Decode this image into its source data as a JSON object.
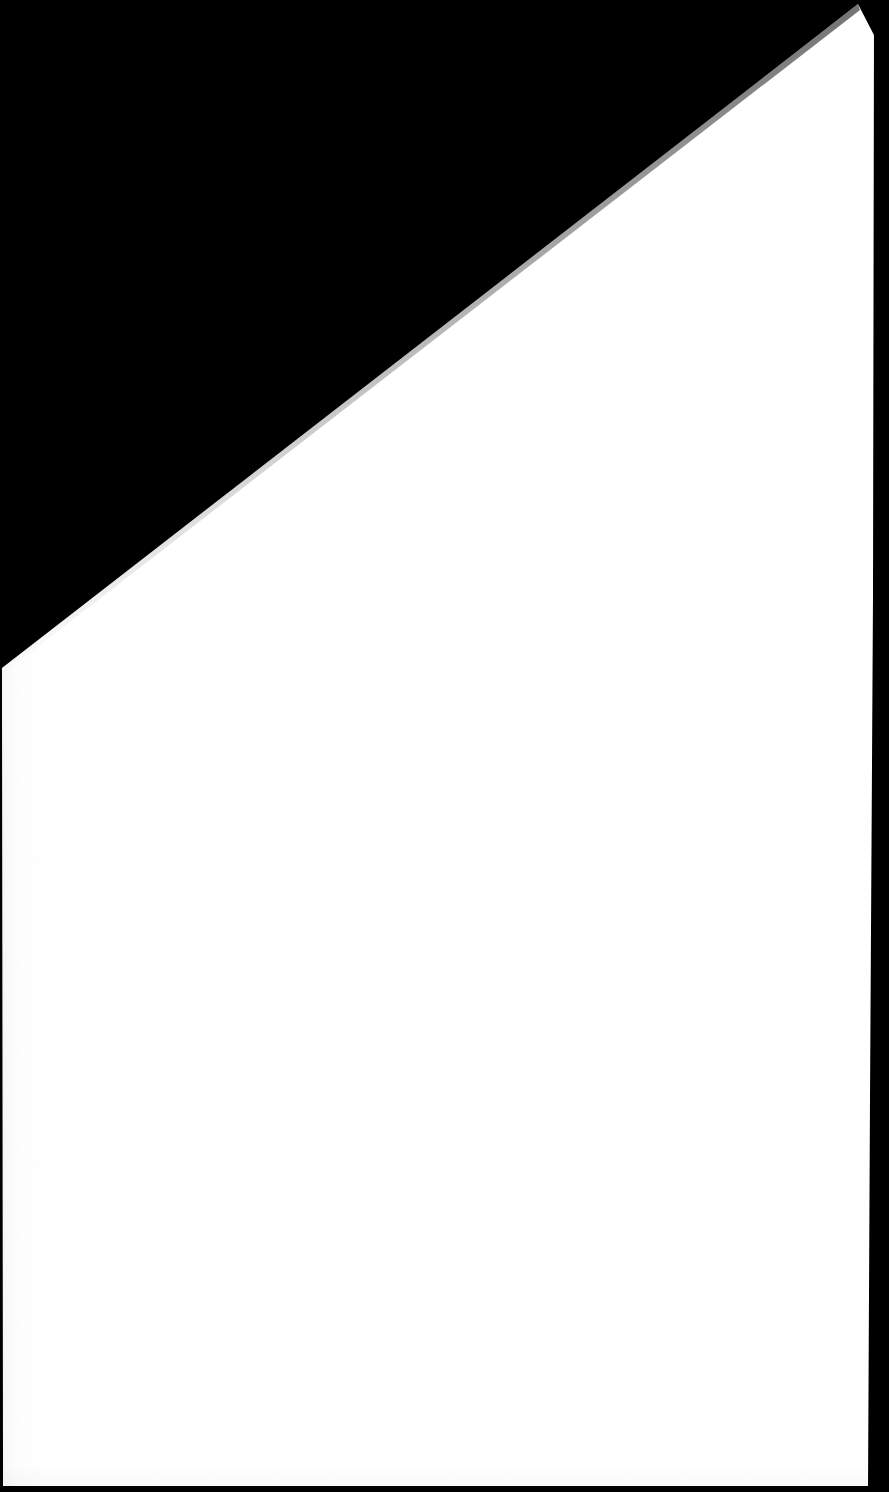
{
  "document": {
    "page_kind": "scanned-blank-page",
    "page_text": "",
    "visible_text_blocks": [],
    "colors": {
      "scanner_background": "#000000",
      "paper": "#ffffff",
      "paper_edge_dark": "#151515",
      "page_bottom_edge": "#0a0a0a"
    },
    "canvas": {
      "width": 889,
      "height": 1492
    },
    "paper_geometry": {
      "description": "skewed white sheet against black scanner backing",
      "top_right_apex": [
        858,
        4
      ],
      "left_edge_intersection": [
        0,
        668
      ],
      "right_edge_top": [
        874,
        35
      ],
      "right_edge_bottom": [
        868,
        1486
      ],
      "bottom_left_corner": [
        3,
        1486
      ],
      "bottom_right_corner": [
        868,
        1486
      ]
    }
  }
}
